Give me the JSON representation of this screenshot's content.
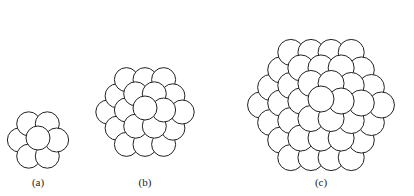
{
  "figure": {
    "panels": [
      {
        "label": "(a)",
        "description": "13-atom cluster"
      },
      {
        "label": "(b)",
        "description": "larger cluster"
      },
      {
        "label": "(c)",
        "description": "largest cluster"
      }
    ]
  }
}
